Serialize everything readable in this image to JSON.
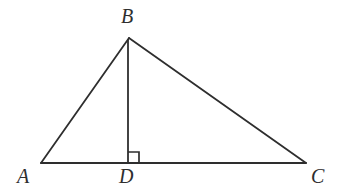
{
  "figure": {
    "type": "geometry-diagram",
    "background_color": "#ffffff",
    "stroke_color": "#2e2e2e",
    "stroke_width": 1.8,
    "label_color": "#2e2e2e",
    "label_style": "italic-serif",
    "label_font_size": 20,
    "points": {
      "A": {
        "label": "A",
        "x": 41,
        "y": 163
      },
      "B": {
        "label": "B",
        "x": 129,
        "y": 38
      },
      "C": {
        "label": "C",
        "x": 306,
        "y": 163
      },
      "D": {
        "label": "D",
        "x": 128,
        "y": 163
      }
    },
    "segments": [
      {
        "name": "segment-AB",
        "from": "A",
        "to": "B"
      },
      {
        "name": "segment-BC",
        "from": "B",
        "to": "C"
      },
      {
        "name": "segment-AC",
        "from": "A",
        "to": "C"
      },
      {
        "name": "segment-BD",
        "from": "B",
        "to": "D"
      }
    ],
    "right_angle_marker": {
      "name": "right-angle-at-D",
      "at_point": "D",
      "size": 11,
      "side": "right",
      "angle_value": "90"
    }
  }
}
